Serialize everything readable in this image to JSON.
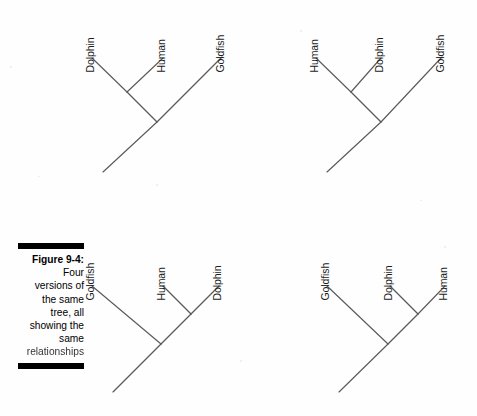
{
  "figure": {
    "caption_label": "Figure 9-4:",
    "caption_lines": [
      "Four",
      "versions of",
      "the same",
      "tree, all",
      "showing the",
      "same"
    ],
    "caption_last_line": "relationships",
    "caption_full": "Figure 9-4: Four versions of the same tree, all showing the same relationships",
    "rule_color": "#000000",
    "line_color": "#5a5a5a",
    "background": "#ffffff"
  },
  "trees": [
    {
      "id": "tree-top-left",
      "name": "tree-top-left",
      "leaves": [
        {
          "label": "Dolphin",
          "label_x": 95,
          "label_y": 62,
          "tip_x": 92,
          "tip_y": 58
        },
        {
          "label": "Human",
          "label_x": 166,
          "label_y": 62,
          "tip_x": 163,
          "tip_y": 58
        },
        {
          "label": "Goldfish",
          "label_x": 225,
          "label_y": 62,
          "tip_x": 222,
          "tip_y": 57
        }
      ],
      "nodes": [
        {
          "name": "mammal-node",
          "x": 127,
          "y": 92
        },
        {
          "name": "root-node",
          "x": 157,
          "y": 122
        }
      ],
      "root_tail": {
        "x": 103,
        "y": 172
      }
    },
    {
      "id": "tree-top-right",
      "name": "tree-top-right",
      "leaves": [
        {
          "label": "Human",
          "label_x": 319,
          "label_y": 62,
          "tip_x": 316,
          "tip_y": 58
        },
        {
          "label": "Dolphin",
          "label_x": 384,
          "label_y": 62,
          "tip_x": 381,
          "tip_y": 58
        },
        {
          "label": "Goldfish",
          "label_x": 445,
          "label_y": 62,
          "tip_x": 442,
          "tip_y": 57
        },
        {
          "label": "",
          "label_x": 0,
          "label_y": 0,
          "tip_x": 0,
          "tip_y": 0
        }
      ],
      "nodes": [
        {
          "name": "mammal-node",
          "x": 351,
          "y": 92
        },
        {
          "name": "root-node",
          "x": 381,
          "y": 122
        }
      ],
      "root_tail": {
        "x": 327,
        "y": 172
      }
    },
    {
      "id": "tree-bottom-left",
      "name": "tree-bottom-left",
      "leaves": [
        {
          "label": "Goldfish",
          "label_x": 95,
          "label_y": 290,
          "tip_x": 92,
          "tip_y": 286
        },
        {
          "label": "Human",
          "label_x": 166,
          "label_y": 290,
          "tip_x": 163,
          "tip_y": 286
        },
        {
          "label": "Dolphin",
          "label_x": 222,
          "label_y": 290,
          "tip_x": 219,
          "tip_y": 286
        }
      ],
      "nodes": [
        {
          "name": "mammal-node",
          "x": 191,
          "y": 314
        },
        {
          "name": "root-node",
          "x": 161,
          "y": 344
        }
      ],
      "root_tail": {
        "x": 113,
        "y": 392
      }
    },
    {
      "id": "tree-bottom-right",
      "name": "tree-bottom-right",
      "leaves": [
        {
          "label": "Goldfish",
          "label_x": 330,
          "label_y": 290,
          "tip_x": 327,
          "tip_y": 286
        },
        {
          "label": "Dolphin",
          "label_x": 393,
          "label_y": 290,
          "tip_x": 390,
          "tip_y": 286
        },
        {
          "label": "Human",
          "label_x": 448,
          "label_y": 290,
          "tip_x": 445,
          "tip_y": 286
        }
      ],
      "nodes": [
        {
          "name": "mammal-node",
          "x": 418,
          "y": 314
        },
        {
          "name": "root-node",
          "x": 388,
          "y": 344
        }
      ],
      "root_tail": {
        "x": 339,
        "y": 392
      }
    }
  ]
}
